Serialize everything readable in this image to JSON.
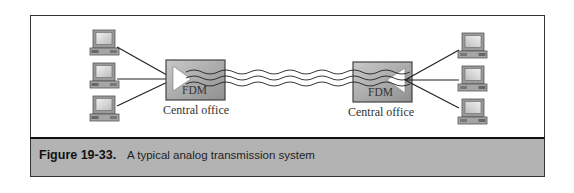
{
  "figure": {
    "number": "Figure 19-33.",
    "caption": "A typical analog transmission system"
  },
  "left_site": {
    "multiplexer_label": "FDM",
    "office_label": "Central office",
    "computers": [
      "computer-1",
      "computer-2",
      "computer-3"
    ]
  },
  "right_site": {
    "multiplexer_label": "FDM",
    "office_label": "Central office",
    "computers": [
      "computer-1",
      "computer-2",
      "computer-3"
    ]
  },
  "link": {
    "type": "analog-wave-lines",
    "line_count": 3
  },
  "colors": {
    "caption_band": "#b3b3b3",
    "fdm_box": "#a8a8a8",
    "frame_border": "#333333"
  }
}
